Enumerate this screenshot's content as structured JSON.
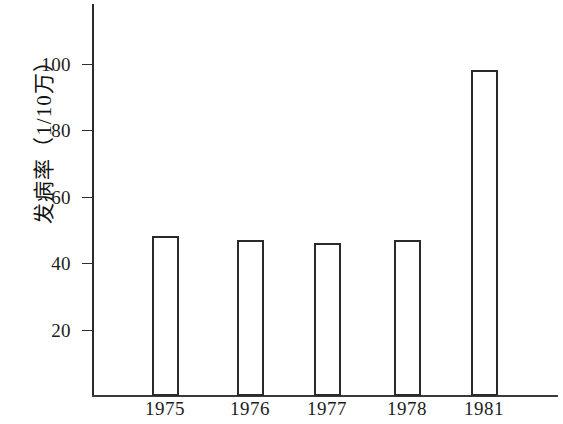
{
  "chart_data": {
    "type": "bar",
    "title": "",
    "subtitle": "",
    "xlabel": "",
    "ylabel": "发病率（1/10万）",
    "categories": [
      "1975",
      "1976",
      "1977",
      "1978",
      "1981"
    ],
    "values": [
      48,
      47,
      46,
      47,
      98
    ],
    "ylim": [
      0,
      115
    ],
    "yticks": [
      20,
      40,
      60,
      80,
      100
    ],
    "ytick_labels": [
      "20",
      "40",
      "60",
      "80",
      "100"
    ],
    "grid": false,
    "legend": null,
    "legend_position": "none",
    "annotations": [],
    "series": [
      {
        "name": "发病率",
        "values": [
          48,
          47,
          46,
          47,
          98
        ]
      }
    ]
  },
  "style": {
    "background_color": "#ffffff",
    "axis_color": "#2b2b2b",
    "bar_edge_color": "#2a2a2a",
    "bar_fill_color": "#ffffff",
    "text_color": "#1c1c1c"
  }
}
